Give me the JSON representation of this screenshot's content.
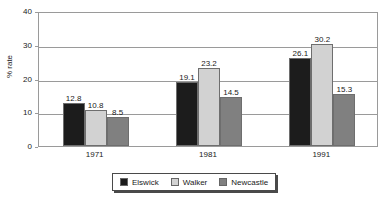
{
  "chart_data": {
    "type": "bar",
    "title": "",
    "subtitle": "",
    "xlabel": "",
    "ylabel": "% rate",
    "categories": [
      "1971",
      "1981",
      "1991"
    ],
    "series": [
      {
        "name": "Elswick",
        "color": "#1c1c1c",
        "values": [
          12.8,
          19.1,
          26.1
        ]
      },
      {
        "name": "Walker",
        "color": "#d2d2d2",
        "values": [
          10.8,
          23.2,
          30.2
        ]
      },
      {
        "name": "Newcastle",
        "color": "#808080",
        "values": [
          8.5,
          14.5,
          15.3
        ]
      }
    ],
    "ylim": [
      0,
      40
    ],
    "yticks": [
      0,
      10,
      20,
      30,
      40
    ],
    "ytick_labels": [
      "0",
      "10",
      "20",
      "30",
      "40"
    ],
    "grid": true,
    "grid_axis": "y",
    "legend_position": "bottom",
    "data_labels": true,
    "data_label_values": [
      [
        "12.8",
        "10.8",
        "8.5"
      ],
      [
        "19.1",
        "23.2",
        "14.5"
      ],
      [
        "26.1",
        "30.2",
        "15.3"
      ]
    ],
    "colors": {
      "axis": "#9a9a9a",
      "grid": "#9a9a9a",
      "text": "#1a1a1a",
      "background": "#ffffff",
      "legend_border": "#4a4a4a"
    }
  }
}
